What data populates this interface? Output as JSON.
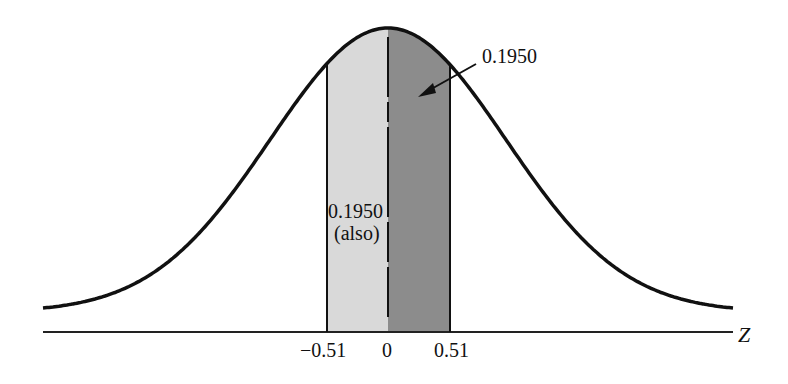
{
  "chart_data": {
    "type": "area",
    "title": "",
    "xlabel": "Z",
    "ylabel": "",
    "xlim": [
      -3.5,
      3.5
    ],
    "distribution": "standard normal",
    "shaded_regions": [
      {
        "name": "left",
        "from": -0.51,
        "to": 0,
        "area": 0.195,
        "label": "0.1950 (also)",
        "color": "#d9d9d9"
      },
      {
        "name": "right",
        "from": 0,
        "to": 0.51,
        "area": 0.195,
        "label": "0.1950",
        "color": "#8c8c8c"
      }
    ],
    "tick_labels": [
      "−0.51",
      "0",
      "0.51"
    ],
    "tick_values": [
      -0.51,
      0,
      0.51
    ],
    "annotations": [
      {
        "text": "0.1950",
        "points_to": "right shaded region",
        "arrow": true
      },
      {
        "text": "0.1950",
        "position": "inside left shaded region"
      },
      {
        "text": "(also)",
        "position": "inside left shaded region"
      }
    ],
    "grid": false,
    "legend": "none"
  },
  "labels": {
    "right_area": "0.1950",
    "left_area": "0.1950",
    "left_also": "(also)",
    "axis_name": "Z",
    "tick_neg": "−0.51",
    "tick_zero": "0",
    "tick_pos": "0.51"
  },
  "colors": {
    "curve": "#111111",
    "axis": "#222222",
    "left_fill": "#d9d9d9",
    "right_fill": "#8c8c8c"
  }
}
